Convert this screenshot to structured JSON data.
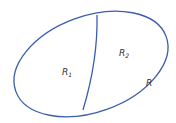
{
  "diagram": {
    "stroke_color": "#3a5dae",
    "label_color": "#333333",
    "regions": [
      {
        "name": "R",
        "sub": "1"
      },
      {
        "name": "R",
        "sub": "2"
      }
    ],
    "boundary_label": "R"
  }
}
